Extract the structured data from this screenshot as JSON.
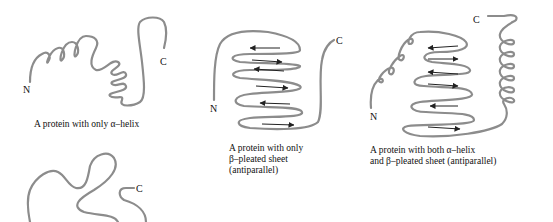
{
  "colors": {
    "chain": "#8c8c8c",
    "arrow": "#222222",
    "text": "#111111",
    "background": "#ffffff"
  },
  "panels": [
    {
      "id": "alpha-only",
      "n_label": "N",
      "c_label": "C",
      "caption": [
        "A protein with only α–helix"
      ]
    },
    {
      "id": "beta-only",
      "n_label": "N",
      "c_label": "C",
      "caption": [
        "A protein with only",
        "β–pleated sheet",
        "(antiparallel)"
      ],
      "strand_directions": [
        "left",
        "right",
        "left",
        "right",
        "left",
        "right"
      ]
    },
    {
      "id": "alpha-and-beta",
      "n_label": "N",
      "c_label": "C",
      "caption": [
        "A protein with both α–helix",
        "and β–pleated sheet (antiparallel)"
      ],
      "strand_directions": [
        "left",
        "right",
        "left",
        "right",
        "left",
        "right"
      ]
    },
    {
      "id": "random-coil",
      "c_label": "C"
    }
  ]
}
